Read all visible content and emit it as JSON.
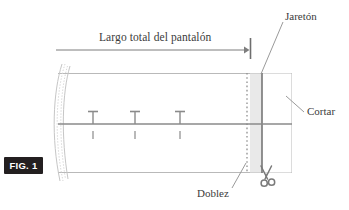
{
  "figure": {
    "id_badge": "FIG. 1",
    "caption_language": "es",
    "background_color": "#ffffff"
  },
  "labels": {
    "measure_label": "Largo total del pantalón",
    "hem_label": "Jaretón",
    "cut_label": "Cortar",
    "fold_label": "Doblez"
  },
  "colors": {
    "outline": "#b9b9b9",
    "center_line": "#8a8a8a",
    "cut_line": "#6e6e6e",
    "shaded_band": "#e9e9e9",
    "leader_line": "#9a9a9a",
    "arrow": "#7d7d7d",
    "badge_bg": "#231f20",
    "badge_text": "#ffffff",
    "text": "#3b3b3b",
    "pin": "#8a8a8a"
  },
  "geometry": {
    "garment": {
      "left": 58,
      "right": 292,
      "top": 73,
      "bottom": 172
    },
    "center_line_y": 124,
    "fold_line_x": 247,
    "cut_line_x": 262,
    "shaded_band": {
      "x": 250,
      "width": 12
    },
    "measure_arrow": {
      "x1": 56,
      "x2": 248,
      "y": 50
    },
    "end_tick": {
      "x": 250,
      "y1": 38,
      "y2": 59
    },
    "pins_x": [
      93,
      135,
      180
    ],
    "pin_cap_y": 111,
    "pin_dash_y": [
      131,
      139
    ]
  },
  "icons": {
    "scissors": "scissors-icon",
    "arrow_head": "arrow-head-right-icon"
  }
}
